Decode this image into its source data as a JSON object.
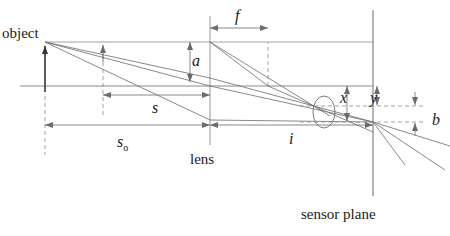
{
  "figure": {
    "type": "optics-ray-diagram",
    "canvas": {
      "width": 450,
      "height": 236
    },
    "colors": {
      "stroke": "#6b6b6b",
      "stroke_dark": "#333333",
      "text": "#1a1a1a",
      "background": "#ffffff"
    },
    "labels": [
      {
        "id": "object",
        "text": "object",
        "style": "word",
        "x": 2,
        "y": 26
      },
      {
        "id": "lens",
        "text": "lens",
        "style": "word",
        "x": 190,
        "y": 152
      },
      {
        "id": "sensor-plane",
        "text": "sensor plane",
        "style": "word",
        "x": 301,
        "y": 207
      },
      {
        "id": "a",
        "text": "a",
        "style": "var",
        "x": 192,
        "y": 53
      },
      {
        "id": "f",
        "text": "f",
        "style": "var",
        "x": 235,
        "y": 8
      },
      {
        "id": "s",
        "text": "s",
        "style": "var",
        "x": 152,
        "y": 100
      },
      {
        "id": "s-o",
        "text": "s",
        "sub": "o",
        "style": "var",
        "x": 117,
        "y": 134
      },
      {
        "id": "i",
        "text": "i",
        "style": "var",
        "x": 289,
        "y": 131
      },
      {
        "id": "x",
        "text": "x",
        "style": "var",
        "x": 340,
        "y": 90
      },
      {
        "id": "y",
        "text": "y",
        "style": "var",
        "x": 370,
        "y": 90
      },
      {
        "id": "b",
        "text": "b",
        "style": "var",
        "x": 432,
        "y": 112
      }
    ],
    "geometry": {
      "optical_axis_y": 86,
      "object_plane_x": 45,
      "object_tip_y": 42,
      "second_arrow_x": 103,
      "second_arrow_tip_y": 43,
      "lens_x": 210,
      "lens_top_y": 40,
      "lens_bottom_y": 126,
      "focal_plane_x": 268,
      "sensor_plane_x": 373,
      "convergence_y": 122,
      "blur_circle_cx": 324,
      "blur_circle_cy": 112,
      "b_dim_x": 415,
      "x_dim_x": 347,
      "y_dim_x": 377
    },
    "dimensions": [
      {
        "id": "f",
        "from_x": 210,
        "to_x": 268,
        "y": 28
      },
      {
        "id": "s",
        "from_x": 103,
        "to_x": 210,
        "y": 95
      },
      {
        "id": "s_o",
        "from_x": 45,
        "to_x": 210,
        "y": 125
      },
      {
        "id": "i",
        "from_x": 210,
        "to_x": 373,
        "y": 125
      }
    ]
  }
}
